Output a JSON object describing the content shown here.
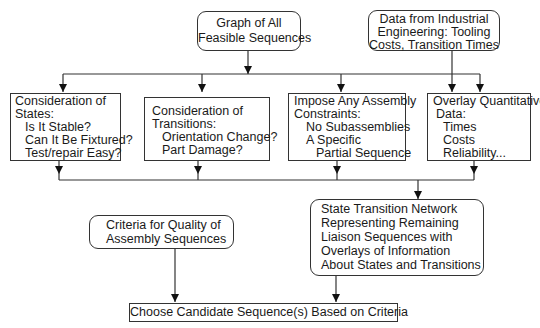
{
  "diagram": {
    "top_sources": [
      {
        "id": "graph",
        "lines": [
          "Graph of All",
          "Feasible Sequences"
        ]
      },
      {
        "id": "ie_data",
        "lines": [
          "Data from Industrial",
          "Engineering: Tooling",
          "Costs, Transition Times"
        ]
      }
    ],
    "considerations": [
      {
        "id": "states",
        "lines": [
          "Consideration of",
          "States:",
          "Is It Stable?",
          "Can It Be Fixtured?",
          "Test/repair Easy?"
        ]
      },
      {
        "id": "transitions",
        "lines": [
          "Consideration of",
          "Transitions:",
          "Orientation Change?",
          "Part Damage?"
        ]
      },
      {
        "id": "constraints",
        "lines": [
          "Impose Any Assembly",
          "Constraints:",
          "No Subassemblies",
          "A Specific",
          "Partial Sequence"
        ]
      },
      {
        "id": "overlay",
        "lines": [
          "Overlay Quantitative",
          "Data:",
          "Times",
          "Costs",
          "Reliability..."
        ]
      }
    ],
    "network": {
      "lines": [
        "State Transition Network",
        "Representing Remaining",
        "Liaison Sequences with",
        "Overlays of Information",
        "About States and Transitions"
      ]
    },
    "criteria": {
      "lines": [
        "Criteria for Quality of",
        "Assembly Sequences"
      ]
    },
    "result": {
      "label": "Choose Candidate Sequence(s) Based on Criteria"
    },
    "colors": {
      "stroke": "#333333",
      "text": "#1a1a1a",
      "background": "#ffffff"
    }
  }
}
